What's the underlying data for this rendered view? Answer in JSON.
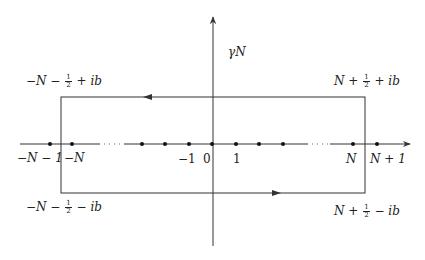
{
  "diagram": {
    "title_label": "γ_N",
    "contour_name": "γN",
    "corners": {
      "top_left": {
        "pre": "−N − ",
        "frac_num": "1",
        "frac_den": "2",
        "post": " + ib"
      },
      "top_right": {
        "pre": "N + ",
        "frac_num": "1",
        "frac_den": "2",
        "post": " + ib"
      },
      "bottom_left": {
        "pre": "−N − ",
        "frac_num": "1",
        "frac_den": "2",
        "post": " − ib"
      },
      "bottom_right": {
        "pre": "N + ",
        "frac_num": "1",
        "frac_den": "2",
        "post": " − ib"
      }
    },
    "axis_labels": {
      "neg_n_minus_1": "−N − 1",
      "neg_n": "−N",
      "neg_1": "−1",
      "zero": "0",
      "one": "1",
      "n": "N",
      "n_plus_1": "N + 1"
    },
    "points_x": [
      50,
      72,
      142,
      165,
      189,
      212,
      236,
      259,
      283,
      353,
      377
    ],
    "rectangle": {
      "left": 61,
      "right": 365,
      "top": 97,
      "bottom": 193
    },
    "orientation": "counterclockwise",
    "colors": {
      "line": "#333333",
      "text": "#222222",
      "background": "#ffffff"
    }
  }
}
